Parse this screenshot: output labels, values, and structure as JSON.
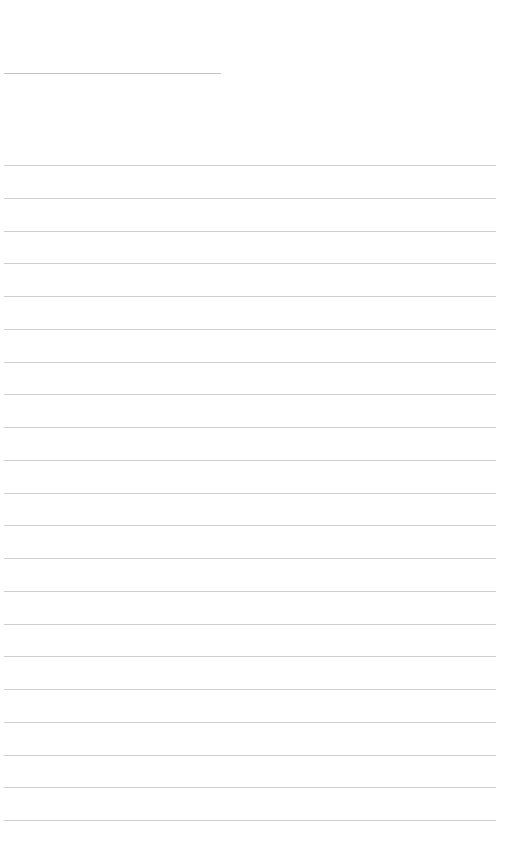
{
  "page": {
    "type": "lined-paper",
    "background_color": "#ffffff",
    "line_color": "#cfcfcf",
    "title_line": {
      "top": 73,
      "left": 4,
      "width": 217
    },
    "ruled_lines": {
      "count": 21,
      "first_top": 165,
      "spacing": 32.75,
      "left": 4,
      "width": 492
    },
    "text_entries": []
  }
}
